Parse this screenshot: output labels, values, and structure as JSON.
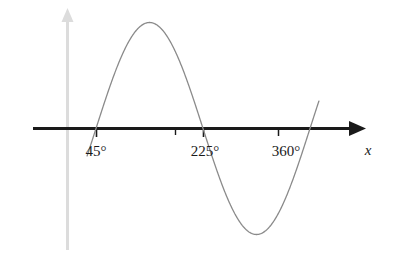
{
  "chart_data": {
    "type": "line",
    "title": "",
    "subtitle": "",
    "xlabel": "x",
    "ylabel": "",
    "xlim": [
      -25,
      470
    ],
    "ylim": [
      -1.35,
      1.35
    ],
    "grid": false,
    "legend": null,
    "function": "sin(x - 45°)",
    "x_tick_values": [
      45,
      135,
      225,
      360
    ],
    "x_tick_labels": [
      "45°",
      "",
      "225°",
      "360°"
    ],
    "x_axis_intercepts": [
      45,
      225,
      405
    ],
    "peak": {
      "x": 135,
      "y": 1
    },
    "trough": {
      "x": 315,
      "y": -1
    },
    "series": [
      {
        "name": "sine-curve",
        "color": "#8a8a8a",
        "x": [
          30,
          45,
          60,
          75,
          90,
          105,
          120,
          135,
          150,
          165,
          180,
          195,
          210,
          225,
          240,
          255,
          270,
          285,
          300,
          315,
          330,
          345,
          360,
          375,
          390,
          405,
          420
        ],
        "y": [
          -0.259,
          0.0,
          0.259,
          0.5,
          0.707,
          0.866,
          0.966,
          1.0,
          0.966,
          0.866,
          0.707,
          0.5,
          0.259,
          0.0,
          -0.259,
          -0.5,
          -0.707,
          -0.866,
          -0.966,
          -1.0,
          -0.966,
          -0.866,
          -0.707,
          -0.5,
          -0.259,
          0.0,
          0.259
        ]
      }
    ]
  },
  "axes": {
    "x_axis": {
      "name": "x-axis",
      "color": "#1a1a1a",
      "arrow": "right",
      "label": "x"
    },
    "y_axis": {
      "name": "y-axis",
      "color": "#dcdcdc",
      "arrow": "up",
      "label": ""
    }
  },
  "ticks": [
    {
      "label": "45°",
      "value": 45,
      "px": 96,
      "labelled": true
    },
    {
      "label": "",
      "value": 135,
      "px": 175,
      "labelled": false
    },
    {
      "label": "225°",
      "value": 225,
      "px": 203,
      "labelled": true
    },
    {
      "label": "360°",
      "value": 360,
      "px": 278,
      "labelled": true
    }
  ],
  "colors": {
    "curve": "#8a8a8a",
    "x_axis": "#1a1a1a",
    "y_axis": "#dcdcdc",
    "text": "#1a1a1a",
    "background": "#ffffff"
  }
}
